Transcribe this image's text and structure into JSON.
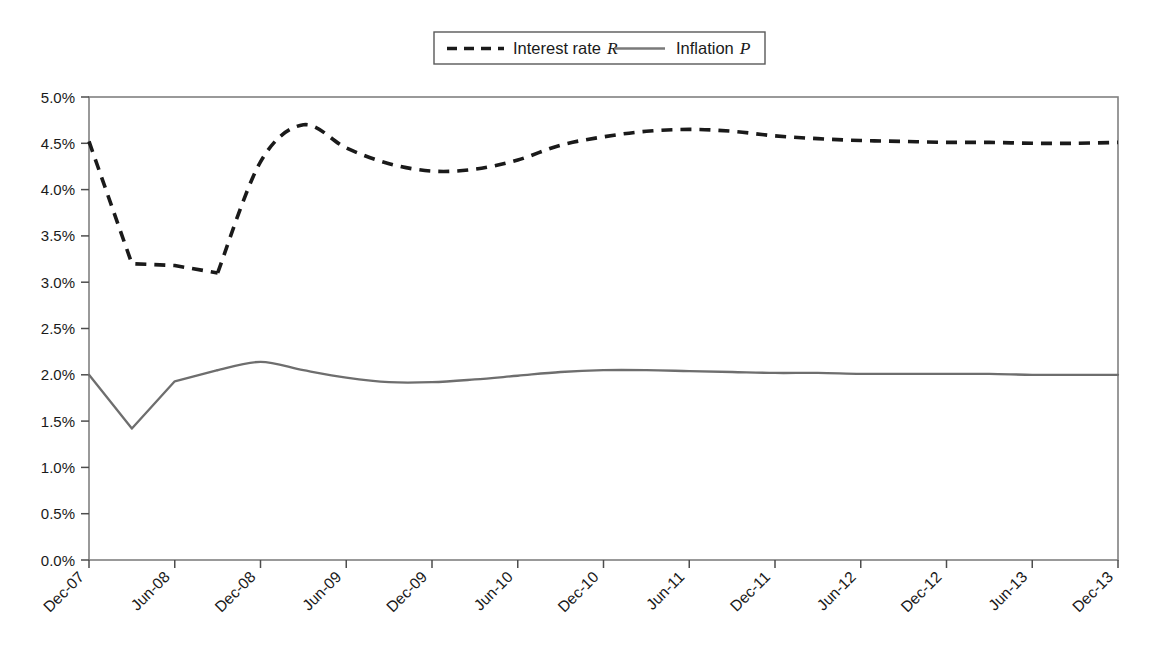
{
  "legend": {
    "position": "top-center",
    "entries": [
      {
        "label": "Interest rate",
        "symbol": "R",
        "style": "dashed",
        "color": "#1a1a1a"
      },
      {
        "label": "Inflation",
        "symbol": "P",
        "style": "solid",
        "color": "#6e6e6e"
      }
    ]
  },
  "axes": {
    "ylabel": "",
    "xlabel": "",
    "yticks": [
      "0.0%",
      "0.5%",
      "1.0%",
      "1.5%",
      "2.0%",
      "2.5%",
      "3.0%",
      "3.5%",
      "4.0%",
      "4.5%",
      "5.0%"
    ],
    "xticks": [
      "Dec-07",
      "Jun-08",
      "Dec-08",
      "Jun-09",
      "Dec-09",
      "Jun-10",
      "Dec-10",
      "Jun-11",
      "Dec-11",
      "Jun-12",
      "Dec-12",
      "Jun-13",
      "Dec-13"
    ]
  },
  "caption": {
    "text": ""
  },
  "chart_data": {
    "type": "line",
    "title": "",
    "subtitle": "",
    "xlabel": "",
    "ylabel": "",
    "ylim": [
      0.0,
      5.0
    ],
    "ytick_values": [
      0.0,
      0.5,
      1.0,
      1.5,
      2.0,
      2.5,
      3.0,
      3.5,
      4.0,
      4.5,
      5.0
    ],
    "ytick_labels": [
      "0.0%",
      "0.5%",
      "1.0%",
      "1.5%",
      "2.0%",
      "2.5%",
      "3.0%",
      "3.5%",
      "4.0%",
      "4.5%",
      "5.0%"
    ],
    "grid": false,
    "legend_position": "top-center",
    "x": [
      "Dec-07",
      "Mar-08",
      "Jun-08",
      "Sep-08",
      "Dec-08",
      "Mar-09",
      "Jun-09",
      "Sep-09",
      "Dec-09",
      "Mar-10",
      "Jun-10",
      "Sep-10",
      "Dec-10",
      "Mar-11",
      "Jun-11",
      "Sep-11",
      "Dec-11",
      "Mar-12",
      "Jun-12",
      "Sep-12",
      "Dec-12",
      "Mar-13",
      "Jun-13",
      "Sep-13",
      "Dec-13"
    ],
    "xtick_labels": [
      "Dec-07",
      "Jun-08",
      "Dec-08",
      "Jun-09",
      "Dec-09",
      "Jun-10",
      "Dec-10",
      "Jun-11",
      "Dec-11",
      "Jun-12",
      "Dec-12",
      "Jun-13",
      "Dec-13"
    ],
    "series": [
      {
        "name": "Interest rate R",
        "style": "dashed",
        "color": "#1a1a1a",
        "values": [
          4.52,
          3.2,
          3.18,
          3.1,
          4.3,
          4.7,
          4.45,
          4.28,
          4.2,
          4.22,
          4.32,
          4.48,
          4.57,
          4.63,
          4.65,
          4.63,
          4.58,
          4.55,
          4.53,
          4.52,
          4.51,
          4.51,
          4.5,
          4.5,
          4.51
        ]
      },
      {
        "name": "Inflation P",
        "style": "solid",
        "color": "#6e6e6e",
        "values": [
          2.0,
          1.42,
          1.93,
          2.05,
          2.14,
          2.05,
          1.97,
          1.92,
          1.92,
          1.95,
          1.99,
          2.03,
          2.05,
          2.05,
          2.04,
          2.03,
          2.02,
          2.02,
          2.01,
          2.01,
          2.01,
          2.01,
          2.0,
          2.0,
          2.0
        ]
      }
    ]
  }
}
